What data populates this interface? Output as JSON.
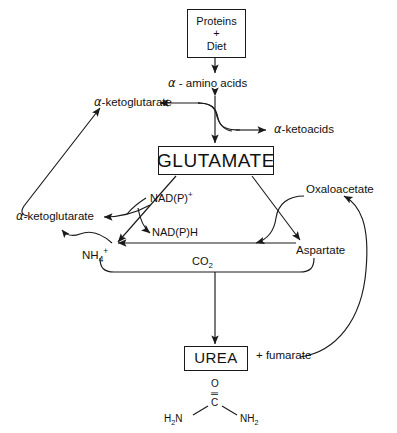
{
  "diagram": {
    "bg_color": "#ffffff",
    "line_color": "#1a1a1a"
  },
  "boxes": {
    "proteins": {
      "line1": "Proteins",
      "line2": "+",
      "line3": "Diet"
    },
    "glutamate": {
      "label": "GLUTAMATE"
    },
    "urea": {
      "label": "UREA"
    }
  },
  "labels": {
    "amino_acids": {
      "alpha": "α",
      "text": " - amino acids"
    },
    "ketoglutarate_top": {
      "alpha": "α",
      "text": "-ketoglutarate"
    },
    "ketoacids": {
      "alpha": "α",
      "text": "-ketoacids"
    },
    "ketoglutarate_left": {
      "alpha": "α",
      "text": "-ketoglutarate"
    },
    "nadp_plus": {
      "text": "NAD(P)",
      "sup": "+"
    },
    "nadph": {
      "text": "NAD(P)H"
    },
    "ammonium": {
      "text": "NH",
      "sub": "4",
      "sup": "+"
    },
    "co2": {
      "text": "CO",
      "sub": "2"
    },
    "oxaloacetate": {
      "text": "Oxaloacetate"
    },
    "aspartate": {
      "text": "Aspartate"
    },
    "fumarate": {
      "text": "+ fumarate"
    }
  },
  "structure": {
    "oxygen": "O",
    "double_bond": "‖",
    "carbon": "C",
    "left_amine": {
      "text": "H",
      "sub": "2",
      "tail": "N"
    },
    "right_amine": {
      "text": "NH",
      "sub": "2"
    }
  }
}
